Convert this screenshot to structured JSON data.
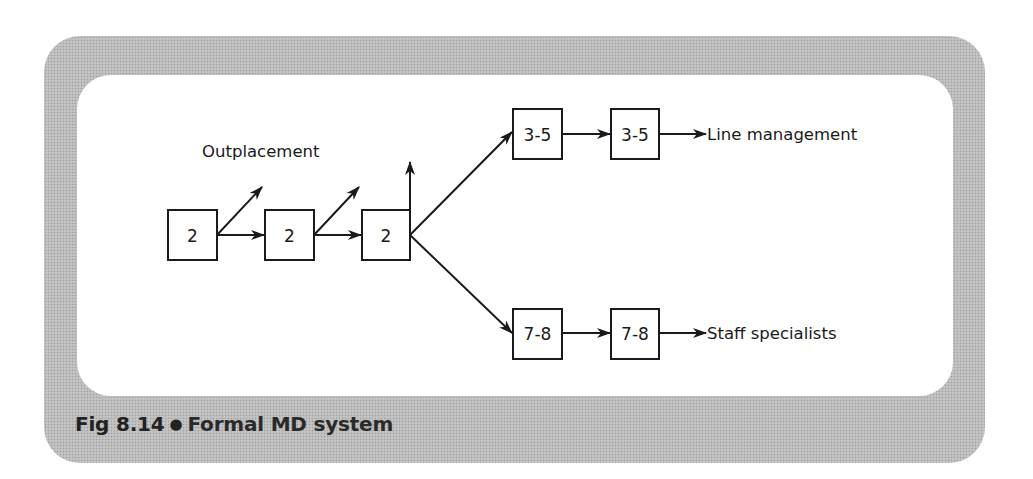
{
  "caption": {
    "figure_number": "Fig 8.14",
    "bullet": "●",
    "title": "Formal MD system"
  },
  "diagram": {
    "labels": {
      "outplacement": "Outplacement",
      "line_management": "Line management",
      "staff_specialists": "Staff specialists"
    },
    "nodes": [
      {
        "id": "n1",
        "label": "2"
      },
      {
        "id": "n2",
        "label": "2"
      },
      {
        "id": "n3",
        "label": "2"
      },
      {
        "id": "n4",
        "label": "3-5"
      },
      {
        "id": "n5",
        "label": "3-5"
      },
      {
        "id": "n6",
        "label": "7-8"
      },
      {
        "id": "n7",
        "label": "7-8"
      }
    ],
    "edges": [
      {
        "from": "n1",
        "to": "n2"
      },
      {
        "from": "n2",
        "to": "n3"
      },
      {
        "from": "n1",
        "to": "outplacement"
      },
      {
        "from": "n2",
        "to": "outplacement"
      },
      {
        "from": "n3",
        "to": "outplacement"
      },
      {
        "from": "n3",
        "to": "n4"
      },
      {
        "from": "n3",
        "to": "n6"
      },
      {
        "from": "n4",
        "to": "n5"
      },
      {
        "from": "n5",
        "to": "line_management"
      },
      {
        "from": "n6",
        "to": "n7"
      },
      {
        "from": "n7",
        "to": "staff_specialists"
      }
    ]
  },
  "colors": {
    "ink": "#1a1a1a",
    "frame": "#bcbcbc",
    "panel": "#ffffff"
  }
}
